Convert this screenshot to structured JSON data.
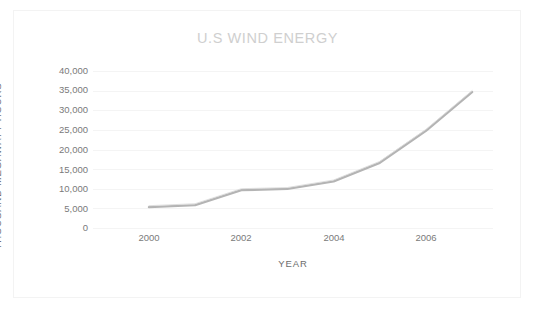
{
  "chart_data": {
    "type": "line",
    "title": "U.S WIND ENERGY",
    "xlabel": "YEAR",
    "ylabel": "THOUSAND MEGAWATT HOURS",
    "x": [
      2000,
      2001,
      2002,
      2003,
      2004,
      2005,
      2006,
      2007
    ],
    "values": [
      5300,
      5800,
      9600,
      9900,
      11800,
      16500,
      24600,
      34400
    ],
    "series": [
      {
        "name": "U.S Wind Energy",
        "values": [
          5300,
          5800,
          9600,
          9900,
          11800,
          16500,
          24600,
          34400
        ]
      }
    ],
    "xtick_labels": [
      "2000",
      "2002",
      "2004",
      "2006"
    ],
    "xtick_values": [
      2000,
      2002,
      2004,
      2006
    ],
    "ytick_labels": [
      "0",
      "5,000",
      "10,000",
      "15,000",
      "20,000",
      "25,000",
      "30,000",
      "35,000",
      "40,000"
    ],
    "ytick_values": [
      0,
      5000,
      10000,
      15000,
      20000,
      25000,
      30000,
      35000,
      40000
    ],
    "xlim": [
      2000,
      2007
    ],
    "ylim": [
      0,
      40000
    ],
    "grid": true,
    "grid_axis": "y",
    "legend": "none",
    "colors": {
      "line": "#b4b4b4",
      "title": "#cfcfcf",
      "axis_text": "#7a7a7a",
      "axis_title": "#6d6d6d",
      "gridline": "#f4f4f4",
      "frame": "#f3f3f3",
      "background": "#ffffff"
    }
  }
}
